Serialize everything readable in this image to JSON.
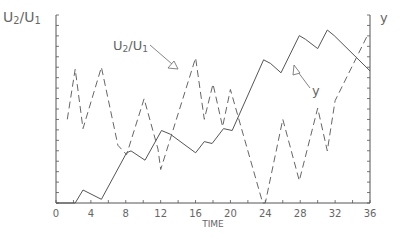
{
  "chart_data": {
    "type": "line",
    "title": "",
    "xlabel": "TIME",
    "ylabel_left": "U2/U1",
    "ylabel_right": "y",
    "xlim": [
      0,
      36
    ],
    "x_ticks": [
      0,
      4,
      8,
      12,
      16,
      20,
      24,
      28,
      32,
      36
    ],
    "grid": false,
    "legend": "annotations with arrows",
    "annotations": [
      {
        "text": "U2/U1",
        "points_to": "solid line"
      },
      {
        "text": "y",
        "points_to": "dashed line"
      }
    ],
    "series": [
      {
        "name": "U2/U1",
        "style": "solid",
        "x": [
          0,
          2.2,
          3.1,
          5.2,
          8.1,
          8.6,
          10.2,
          12.1,
          13.1,
          16.0,
          17.0,
          17.9,
          19.2,
          20.2,
          23.8,
          24.6,
          25.8,
          27.9,
          28.6,
          30.0,
          31.1,
          31.9,
          36.0
        ],
        "values_norm": [
          0.0,
          0.0,
          0.07,
          0.02,
          0.27,
          0.28,
          0.23,
          0.39,
          0.37,
          0.27,
          0.33,
          0.32,
          0.4,
          0.39,
          0.77,
          0.75,
          0.7,
          0.9,
          0.88,
          0.83,
          0.93,
          0.9,
          0.71
        ]
      },
      {
        "name": "y",
        "style": "dashed",
        "x": [
          1.3,
          2.2,
          3.1,
          5.2,
          7.1,
          8.1,
          10.1,
          11.7,
          12.0,
          16.0,
          17.0,
          18.0,
          19.1,
          20.0,
          23.7,
          24.0,
          26.0,
          27.9,
          30.0,
          31.1,
          32.0,
          35.8
        ],
        "values_norm": [
          0.45,
          0.72,
          0.4,
          0.73,
          0.31,
          0.26,
          0.56,
          0.29,
          0.18,
          0.78,
          0.45,
          0.64,
          0.41,
          0.61,
          0.0,
          0.0,
          0.45,
          0.12,
          0.51,
          0.28,
          0.55,
          0.91
        ]
      }
    ]
  },
  "labels": {
    "left_axis": "U2/U1",
    "right_axis": "y",
    "x_axis": "TIME",
    "annot_u": "U2/U1",
    "annot_y": "y"
  },
  "colors": {
    "solid": "#555555",
    "dashed": "#666666",
    "axis": "#555555"
  }
}
